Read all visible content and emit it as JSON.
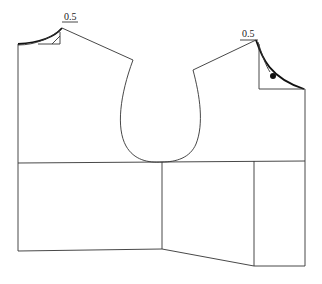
{
  "diagram": {
    "type": "garment-pattern-draft",
    "labels": {
      "left_neck_measure": "0.5",
      "right_neck_measure": "0.5"
    },
    "colors": {
      "line": "#333333",
      "emphasis": "#111111",
      "background": "#ffffff"
    },
    "pieces": [
      {
        "name": "back-bodice-upper"
      },
      {
        "name": "front-bodice-upper"
      },
      {
        "name": "back-skirt-panel"
      },
      {
        "name": "front-side-panel"
      },
      {
        "name": "front-center-panel"
      }
    ],
    "markers": [
      {
        "name": "notch-dot",
        "position": "right-neckline"
      }
    ]
  }
}
